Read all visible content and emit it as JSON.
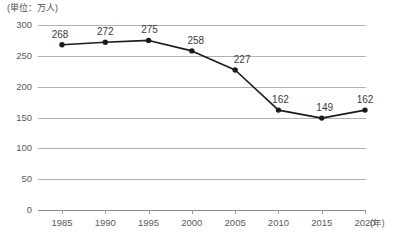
{
  "chart_data": {
    "type": "line",
    "title": "",
    "subtitle": "",
    "unit_caption": "(単位：万人)",
    "xlabel": "(年)",
    "ylabel": "",
    "categories": [
      "1985",
      "1990",
      "1995",
      "2000",
      "2005",
      "2010",
      "2015",
      "2020"
    ],
    "x": [
      1985,
      1990,
      1995,
      2000,
      2005,
      2010,
      2015,
      2020
    ],
    "values": [
      268,
      272,
      275,
      258,
      227,
      162,
      149,
      162
    ],
    "point_labels": [
      "268",
      "272",
      "275",
      "258",
      "227",
      "162",
      "149",
      "162"
    ],
    "ylim": [
      0,
      300
    ],
    "yticks": [
      300,
      250,
      200,
      150,
      100,
      50,
      0
    ],
    "ytick_labels": [
      "300",
      "250",
      "200",
      "150",
      "100",
      "50",
      "0"
    ],
    "grid": true,
    "grid_axis": "y",
    "legend": false,
    "legend_position": "none",
    "series_color": "#1a1a1a",
    "grid_color": "#b0b0b0",
    "axis_color": "#8a8a8a",
    "text_color": "#5a5a5a",
    "background_color": "#ffffff",
    "marker": "circle",
    "marker_filled": true
  }
}
